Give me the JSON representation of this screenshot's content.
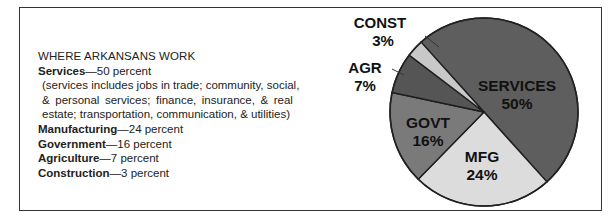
{
  "chart_data": {
    "type": "pie",
    "title": "WHERE ARKANSANS WORK",
    "categories": [
      "Services",
      "Manufacturing",
      "Government",
      "Agriculture",
      "Construction"
    ],
    "values": [
      50,
      24,
      16,
      7,
      3
    ],
    "unit": "percent",
    "slice_labels": [
      {
        "name": "SERVICES",
        "pct": "50%",
        "color": "#5e5e5e"
      },
      {
        "name": "MFG",
        "pct": "24%",
        "color": "#dcdcdc"
      },
      {
        "name": "GOVT",
        "pct": "16%",
        "color": "#7a7a7a"
      },
      {
        "name": "AGR",
        "pct": "7%",
        "color": "#555555"
      },
      {
        "name": "CONST",
        "pct": "3%",
        "color": "#c8c8c8"
      }
    ],
    "legend_position": "left"
  },
  "legend": {
    "title": "WHERE ARKANSANS WORK",
    "rows": [
      {
        "label": "Services",
        "value": "—50 percent"
      },
      {
        "label": "Manufacturing",
        "value": "—24 percent"
      },
      {
        "label": "Government",
        "value": "—16 percent"
      },
      {
        "label": "Agriculture",
        "value": "—7 percent"
      },
      {
        "label": "Construction",
        "value": "—3 percent"
      }
    ],
    "services_note": [
      "(services includes jobs in trade; community, social,",
      "& personal services; finance, insurance, & real",
      "estate; transportation, communication, & utilities)"
    ]
  }
}
